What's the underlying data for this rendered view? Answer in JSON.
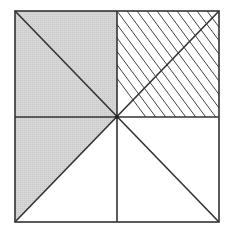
{
  "diagram": {
    "colors": {
      "background": "#ffffff",
      "stroke": "#333333",
      "shade": "#d2d2d2",
      "hatch": "#444444"
    },
    "square": {
      "x1": 15,
      "y1": 11,
      "x2": 219,
      "y2": 222
    },
    "center": {
      "x": 117,
      "y": 117
    },
    "regions": [
      {
        "id": "top-left-quadrant",
        "fill": "shaded"
      },
      {
        "id": "bottom-left-upper-triangle",
        "fill": "shaded"
      },
      {
        "id": "top-right-quadrant",
        "fill": "hatched"
      },
      {
        "id": "bottom-left-lower-triangle",
        "fill": "none"
      },
      {
        "id": "bottom-right-quadrant",
        "fill": "none"
      }
    ],
    "hatch_lines": 10
  }
}
